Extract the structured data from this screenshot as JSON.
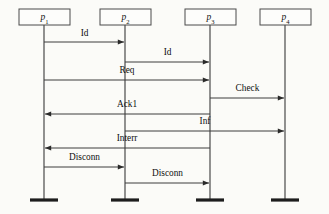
{
  "diagram": {
    "type": "uml-sequence-diagram",
    "title": "",
    "width": 329,
    "height": 214,
    "background_color": "#fbfbf8",
    "line_color": "#3c3c3c",
    "text_color": "#101010",
    "lifelines": [
      {
        "id": "p1",
        "label_base": "p",
        "label_sub": "1",
        "x": 44,
        "box_left": 19,
        "box_right": 70,
        "box_top": 9,
        "box_bottom": 25,
        "foot_y": 200
      },
      {
        "id": "p2",
        "label_base": "p",
        "label_sub": "2",
        "x": 125,
        "box_left": 100,
        "box_right": 151,
        "box_top": 9,
        "box_bottom": 25,
        "foot_y": 200
      },
      {
        "id": "p3",
        "label_base": "p",
        "label_sub": "3",
        "x": 210,
        "box_left": 185,
        "box_right": 236,
        "box_top": 9,
        "box_bottom": 25,
        "foot_y": 200
      },
      {
        "id": "p4",
        "label_base": "p",
        "label_sub": "4",
        "x": 285,
        "box_left": 260,
        "box_right": 311,
        "box_top": 9,
        "box_bottom": 25,
        "foot_y": 200
      }
    ],
    "messages": [
      {
        "seq": 1,
        "label": "Id",
        "from": "p1",
        "to": "p2",
        "direction": "right",
        "y": 42,
        "label_y": 36
      },
      {
        "seq": 2,
        "label": "Id",
        "from": "p2",
        "to": "p3",
        "direction": "right",
        "y": 62,
        "label_y": 55
      },
      {
        "seq": 3,
        "label": "Req",
        "from": "p1",
        "to": "p3",
        "direction": "right",
        "y": 80,
        "label_y": 73
      },
      {
        "seq": 4,
        "label": "Check",
        "from": "p3",
        "to": "p4",
        "direction": "right",
        "y": 98,
        "label_y": 91
      },
      {
        "seq": 5,
        "label": "Ack1",
        "from": "p3",
        "to": "p1",
        "direction": "left",
        "y": 114,
        "label_y": 107
      },
      {
        "seq": 6,
        "label": "Inf",
        "from": "p2",
        "to": "p4",
        "direction": "right",
        "y": 131,
        "label_y": 124
      },
      {
        "seq": 7,
        "label": "Interr",
        "from": "p3",
        "to": "p1",
        "direction": "left",
        "y": 148,
        "label_y": 141
      },
      {
        "seq": 8,
        "label": "Disconn",
        "from": "p1",
        "to": "p2",
        "direction": "right",
        "y": 167,
        "label_y": 160
      },
      {
        "seq": 9,
        "label": "Disconn",
        "from": "p2",
        "to": "p3",
        "direction": "right",
        "y": 183,
        "label_y": 176
      }
    ]
  }
}
